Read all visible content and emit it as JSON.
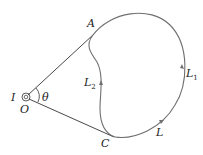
{
  "diagram": {
    "type": "physics-closed-loop-curve",
    "colors": {
      "line": "#333333",
      "curve": "#707070",
      "text": "#222222"
    },
    "points": {
      "O": {
        "label": "O",
        "x": 26,
        "y": 97
      },
      "A": {
        "label": "A",
        "x": 93,
        "y": 35
      },
      "C": {
        "label": "C",
        "x": 115,
        "y": 137
      }
    },
    "labels": {
      "I": "I",
      "O": "O",
      "theta": "θ",
      "A": "A",
      "C": "C",
      "L": "L",
      "L1_base": "L",
      "L1_sub": "1",
      "L2_base": "L",
      "L2_sub": "2"
    },
    "curves": [
      {
        "name": "L1",
        "description": "outer arc from A through right side to C"
      },
      {
        "name": "L2",
        "description": "inner arc from A down to C"
      }
    ]
  }
}
